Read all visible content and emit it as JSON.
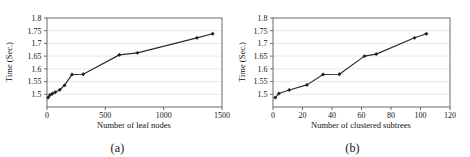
{
  "figure": {
    "panels": [
      {
        "caption": "(a)",
        "chart_key": 0
      },
      {
        "caption": "(b)",
        "chart_key": 1
      }
    ]
  },
  "chart_data": [
    {
      "type": "line",
      "title": "",
      "xlabel": "Number of leaf nodes",
      "ylabel": "Time (Sec.)",
      "xlim": [
        0,
        1500
      ],
      "ylim": [
        1.45,
        1.8
      ],
      "xticks": [
        0,
        500,
        1000,
        1500
      ],
      "xticklabels": [
        "0",
        "500",
        "1000",
        "1500"
      ],
      "yticks": [
        1.5,
        1.55,
        1.6,
        1.65,
        1.7,
        1.75,
        1.8
      ],
      "yticklabels": [
        "1.5",
        "1.55",
        "1.6",
        "1.65",
        "1.7",
        "1.75",
        "1.8"
      ],
      "grid": "horizontal",
      "legend": "none",
      "marker": "diamond",
      "x": [
        10,
        25,
        45,
        70,
        110,
        150,
        215,
        310,
        620,
        775,
        1285,
        1420
      ],
      "y": [
        1.487,
        1.497,
        1.502,
        1.508,
        1.518,
        1.535,
        1.578,
        1.579,
        1.655,
        1.663,
        1.722,
        1.738
      ]
    },
    {
      "type": "line",
      "title": "",
      "xlabel": "Number of clustered subtrees",
      "ylabel": "Time (Sec.)",
      "xlim": [
        0,
        120
      ],
      "ylim": [
        1.45,
        1.8
      ],
      "xticks": [
        0,
        20,
        40,
        60,
        80,
        100,
        120
      ],
      "xticklabels": [
        "0",
        "20",
        "40",
        "60",
        "80",
        "100",
        "120"
      ],
      "yticks": [
        1.5,
        1.55,
        1.6,
        1.65,
        1.7,
        1.75,
        1.8
      ],
      "yticklabels": [
        "1.5",
        "1.55",
        "1.6",
        "1.65",
        "1.7",
        "1.75",
        "1.8"
      ],
      "grid": "horizontal",
      "legend": "none",
      "marker": "diamond",
      "x": [
        1.5,
        4,
        11,
        23,
        34,
        45,
        62,
        70,
        96,
        104
      ],
      "y": [
        1.487,
        1.503,
        1.517,
        1.537,
        1.578,
        1.579,
        1.65,
        1.658,
        1.722,
        1.738
      ]
    }
  ],
  "colors": {
    "line": "#2b2b2b",
    "marker": "#1d1d1d",
    "grid": "#d9d9d9",
    "frame": "#6a6a6a",
    "text": "#141414",
    "background": "#ffffff"
  }
}
